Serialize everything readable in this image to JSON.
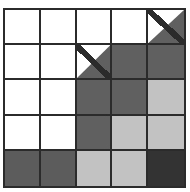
{
  "canvas": {
    "width": 190,
    "height": 192,
    "background": "#ffffff"
  },
  "grid": {
    "title": "",
    "rows": 5,
    "columns": 5,
    "line_color": "#2b2b2b",
    "line_width_px": 2,
    "origin": {
      "x": 3,
      "y": 8
    },
    "size": {
      "width": 183,
      "height": 180
    },
    "palette": {
      "white": "#ffffff",
      "light": "#c2c2c2",
      "medium": "#5c5c5c",
      "dark": "#606060",
      "darkest": "#333333"
    },
    "legend": [
      {
        "key": "white",
        "label": "empty",
        "color": "#ffffff"
      },
      {
        "key": "light",
        "label": "light-gray",
        "color": "#c2c2c2"
      },
      {
        "key": "medium",
        "label": "medium-gray",
        "color": "#5c5c5c"
      },
      {
        "key": "dark",
        "label": "dark-gray",
        "color": "#606060"
      },
      {
        "key": "darkest",
        "label": "darkest-gray",
        "color": "#333333"
      },
      {
        "key": "diagonal",
        "label": "diagonal-half",
        "color": "#606060"
      }
    ],
    "cells": [
      [
        {
          "fill": "white",
          "shape": "square"
        },
        {
          "fill": "white",
          "shape": "square"
        },
        {
          "fill": "white",
          "shape": "square"
        },
        {
          "fill": "white",
          "shape": "square"
        },
        {
          "fill": "dark",
          "shape": "diagonal-bl-tr"
        }
      ],
      [
        {
          "fill": "white",
          "shape": "square"
        },
        {
          "fill": "white",
          "shape": "square"
        },
        {
          "fill": "dark",
          "shape": "diagonal-bl-tr"
        },
        {
          "fill": "dark",
          "shape": "square"
        },
        {
          "fill": "dark",
          "shape": "square"
        }
      ],
      [
        {
          "fill": "white",
          "shape": "square"
        },
        {
          "fill": "white",
          "shape": "square"
        },
        {
          "fill": "dark",
          "shape": "square"
        },
        {
          "fill": "dark",
          "shape": "square"
        },
        {
          "fill": "light",
          "shape": "square"
        }
      ],
      [
        {
          "fill": "white",
          "shape": "square"
        },
        {
          "fill": "white",
          "shape": "square"
        },
        {
          "fill": "dark",
          "shape": "square"
        },
        {
          "fill": "light",
          "shape": "square"
        },
        {
          "fill": "light",
          "shape": "square"
        }
      ],
      [
        {
          "fill": "medium",
          "shape": "square"
        },
        {
          "fill": "medium",
          "shape": "square"
        },
        {
          "fill": "light",
          "shape": "square"
        },
        {
          "fill": "light",
          "shape": "square"
        },
        {
          "fill": "darkest",
          "shape": "square"
        }
      ]
    ]
  }
}
